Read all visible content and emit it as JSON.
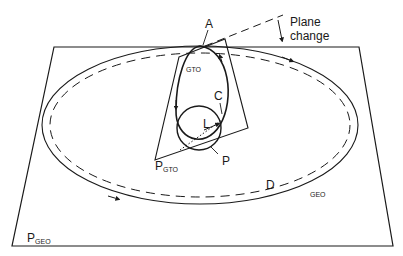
{
  "diagram": {
    "labels": {
      "apogee": "A",
      "plane_change_line1": "Plane",
      "plane_change_line2": "change",
      "gto_orbit": "GTO",
      "circ_point": "C",
      "launch": "L",
      "perigee": "P",
      "gto_plane_main": "P",
      "gto_plane_sub": "GTO",
      "drift": "D",
      "geo_orbit": "GEO",
      "geo_plane_main": "P",
      "geo_plane_sub": "GEO"
    },
    "colors": {
      "stroke": "#1a1a1a",
      "background": "#ffffff"
    }
  }
}
